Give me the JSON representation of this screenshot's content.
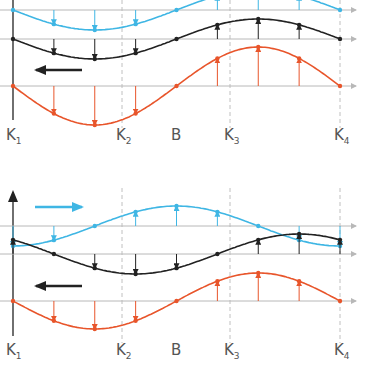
{
  "diagram": {
    "colors": {
      "cyan": "#3fb6e4",
      "black": "#222222",
      "red": "#e8552b",
      "grid": "#b8b8b8",
      "dashed": "#b0b0b0",
      "label": "#555555"
    },
    "x_positions": {
      "K1": 13,
      "K2": 122,
      "B": 176,
      "K3": 230,
      "K4": 340
    },
    "panels": [
      {
        "id": "top",
        "wave_direction": "left",
        "direction_arrow": {
          "color": "black",
          "from_x": 82,
          "to_x": 36,
          "y": 70
        },
        "rows": [
          {
            "name": "cyan-wave",
            "color": "cyan",
            "baseline_y": 10,
            "amplitude": -20,
            "phase": "trough-at-quarter"
          },
          {
            "name": "black-wave",
            "color": "black",
            "baseline_y": 39,
            "amplitude": 20,
            "phase": "trough-at-quarter"
          },
          {
            "name": "red-wave",
            "color": "red",
            "baseline_y": 86,
            "amplitude": 39,
            "phase": "trough-at-quarter"
          }
        ],
        "labels": [
          {
            "main": "K",
            "sub": "1",
            "x": 6,
            "y": 128
          },
          {
            "main": "K",
            "sub": "2",
            "x": 116,
            "y": 128
          },
          {
            "main": "B",
            "sub": "",
            "x": 171,
            "y": 128
          },
          {
            "main": "K",
            "sub": "3",
            "x": 224,
            "y": 128
          },
          {
            "main": "K",
            "sub": "4",
            "x": 334,
            "y": 128
          }
        ]
      },
      {
        "id": "bottom",
        "wave_direction": "both",
        "direction_arrows": [
          {
            "color": "cyan",
            "from_x": 35,
            "to_x": 82,
            "y": 207
          },
          {
            "color": "black",
            "from_x": 82,
            "to_x": 36,
            "y": 286
          }
        ],
        "rows": [
          {
            "name": "cyan-wave",
            "color": "cyan",
            "baseline_y": 226,
            "amplitude": 20
          },
          {
            "name": "black-wave",
            "color": "black",
            "baseline_y": 254,
            "amplitude": 20
          },
          {
            "name": "red-wave",
            "color": "red",
            "baseline_y": 301,
            "amplitude": 28
          }
        ],
        "labels": [
          {
            "main": "K",
            "sub": "1",
            "x": 6,
            "y": 343
          },
          {
            "main": "K",
            "sub": "2",
            "x": 116,
            "y": 343
          },
          {
            "main": "B",
            "sub": "",
            "x": 171,
            "y": 343
          },
          {
            "main": "K",
            "sub": "3",
            "x": 224,
            "y": 343
          },
          {
            "main": "K",
            "sub": "4",
            "x": 334,
            "y": 343
          }
        ]
      }
    ]
  }
}
